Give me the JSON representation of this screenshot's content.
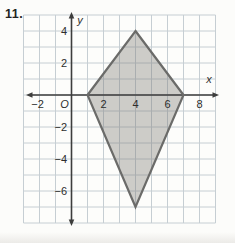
{
  "page": {
    "problem_number": "11."
  },
  "chart_data": {
    "type": "line",
    "title": "",
    "shape_name": "kite",
    "polygon": {
      "closed": true,
      "vertices": [
        [
          4,
          4
        ],
        [
          7,
          0
        ],
        [
          4,
          -7
        ],
        [
          1,
          0
        ]
      ],
      "fill": "rgba(126,124,118,0.38)",
      "stroke": "#6b6b69"
    },
    "axes": {
      "xlabel": "x",
      "ylabel": "y",
      "origin_label": "O",
      "xlim": [
        -3,
        9
      ],
      "ylim": [
        -8,
        5
      ],
      "grid_step": 1,
      "grid_on": true,
      "x_ticks": [
        {
          "label": "−2",
          "x": -2
        },
        {
          "label": "2",
          "x": 2
        },
        {
          "label": "4",
          "x": 4
        },
        {
          "label": "6",
          "x": 6
        },
        {
          "label": "8",
          "x": 8
        }
      ],
      "y_ticks": [
        {
          "label": "4",
          "y": 4
        },
        {
          "label": "2",
          "y": 2
        },
        {
          "label": "−2",
          "y": -2
        },
        {
          "label": "−4",
          "y": -4
        },
        {
          "label": "−6",
          "y": -6
        }
      ]
    },
    "colors": {
      "paper": "#fdfdfb",
      "gridline": "#c6ced3",
      "axis": "#3d3d3c",
      "tick_text": "#2e2e2d"
    }
  }
}
